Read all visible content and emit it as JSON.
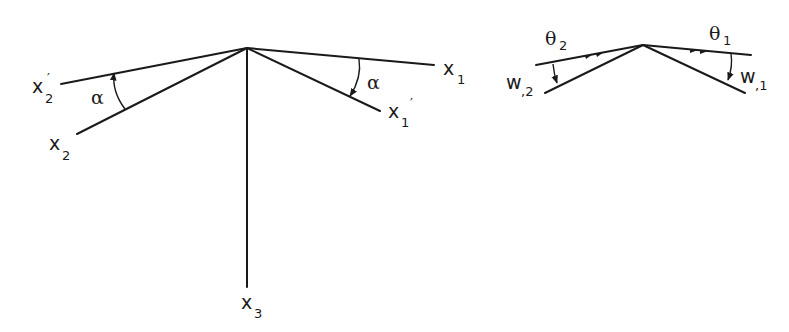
{
  "figure": {
    "left_panel": {
      "description": "Axis rotation by angle alpha about x3",
      "axes": {
        "x1": {
          "base": "x",
          "sub": "1",
          "prime": ""
        },
        "x1_prime": {
          "base": "x",
          "sub": "1",
          "prime": "′"
        },
        "x2": {
          "base": "x",
          "sub": "2",
          "prime": ""
        },
        "x2_prime": {
          "base": "x",
          "sub": "2",
          "prime": "′"
        },
        "x3": {
          "base": "x",
          "sub": "3",
          "prime": ""
        }
      },
      "angle_labels": {
        "left": "α",
        "right": "α"
      }
    },
    "right_panel": {
      "description": "Rotations theta and derivatives w",
      "theta1": {
        "base": "θ",
        "sub": "1"
      },
      "theta2": {
        "base": "θ",
        "sub": "2"
      },
      "w1": {
        "base": "w",
        "sub": ",1"
      },
      "w2": {
        "base": "w",
        "sub": ",2"
      }
    },
    "colors": {
      "ink": "#1a1a1a",
      "background": "#ffffff"
    }
  }
}
